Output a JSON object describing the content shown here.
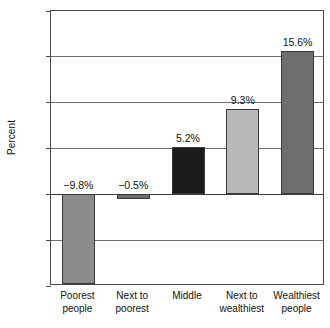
{
  "chart_data": {
    "type": "bar",
    "title": "",
    "subtitle": "",
    "xlabel": "",
    "ylabel": "Percent",
    "categories": [
      "Poorest people",
      "Next to poorest",
      "Middle",
      "Next to wealthiest",
      "Wealthiest people"
    ],
    "category_lines": [
      [
        "Poorest",
        "people"
      ],
      [
        "Next to",
        "poorest"
      ],
      [
        "Middle",
        ""
      ],
      [
        "Next to",
        "wealthiest"
      ],
      [
        "Wealthiest",
        "people"
      ]
    ],
    "values": [
      -9.8,
      -0.5,
      5.2,
      9.3,
      15.6
    ],
    "value_labels": [
      "−9.8%",
      "−0.5%",
      "5.2%",
      "9.3%",
      "15.6%"
    ],
    "bar_colors": [
      "#8c8c8c",
      "#6e6e6e",
      "#1a1a1a",
      "#b9b9b9",
      "#6e6e6e"
    ],
    "ylim": [
      -10,
      20
    ],
    "yticks": [
      20,
      15,
      10,
      5,
      0,
      -5,
      -10
    ],
    "ytick_labels": [
      "20",
      "15",
      "10",
      "5",
      "0",
      "−5",
      "−10"
    ],
    "grid": true,
    "legend": "none"
  }
}
